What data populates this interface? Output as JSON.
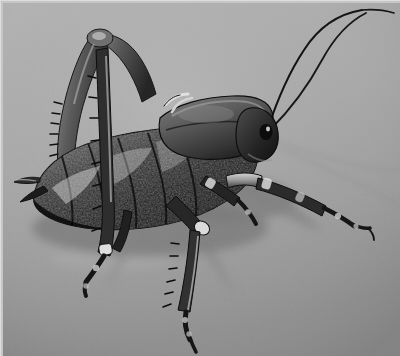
{
  "image": {
    "kind": "photograph",
    "medium": "black-and-white photograph",
    "width": 400,
    "height": 356,
    "subject": "dark bush-cricket (katydid) standing on a smooth gray surface",
    "orientation": "insect facing right, body in profile",
    "lighting": "single soft light from upper right casting soft shadows to the lower left and right",
    "border": {
      "present": true,
      "thickness_px": 3,
      "color": "#c6c6c6",
      "edges": "top and left light margin"
    },
    "background": {
      "description": "plain seamless gray studio surface with subtle vignette",
      "color_top_left": "#b0b0b0",
      "color_top_right": "#a9a9a9",
      "color_center": "#a2a2a2",
      "color_bottom_left": "#9a9a9a",
      "color_bottom_right": "#8f8f8f"
    },
    "palette": {
      "background_gray": "#a6a6a6",
      "shadow_gray": "#7e7e7e",
      "body_dark": "#1d1d1d",
      "body_mid": "#4a4a4a",
      "highlight": "#d8d8d8",
      "border_light": "#c6c6c6"
    },
    "subject_parts": [
      {
        "name": "antenna-left",
        "description": "long thread-like antenna sweeping up and right, crossing the other"
      },
      {
        "name": "antenna-right",
        "description": "second long antenna arcing to the top right corner"
      },
      {
        "name": "antenna-shadow",
        "description": "faint gray shadows of both antennae on the surface behind"
      },
      {
        "name": "head",
        "description": "small dark head with compound eye at right end of body"
      },
      {
        "name": "eye",
        "description": "dark round compound eye with a small highlight"
      },
      {
        "name": "pronotum",
        "description": "smooth saddle-shaped plate over the thorax, lighter than abdomen"
      },
      {
        "name": "abdomen",
        "description": "bulky segmented abdomen with rough speckled texture and specular highlights"
      },
      {
        "name": "hind-leg-femur",
        "description": "thick raised femur angling up and left with a row of spines"
      },
      {
        "name": "hind-leg-tibia",
        "description": "long spined tibia descending to the lower left"
      },
      {
        "name": "hind-tarsus",
        "description": "small foot segments at the lower left end of the hind leg"
      },
      {
        "name": "middle-leg",
        "description": "spined leg descending to the bottom center of the frame"
      },
      {
        "name": "front-leg",
        "description": "pale banded leg extending forward and down to the right"
      },
      {
        "name": "cercus",
        "description": "short pointed appendage at the rear tip of the abdomen, pointing left"
      },
      {
        "name": "body-shadow",
        "description": "soft cast shadow beneath the insect fanning to the lower left and right"
      }
    ],
    "overlay_text": []
  }
}
